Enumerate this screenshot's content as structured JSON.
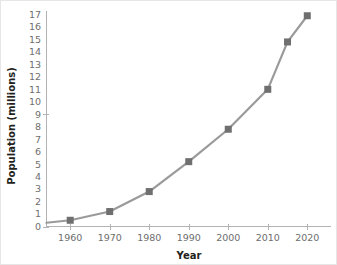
{
  "chart_data": {
    "type": "line",
    "title": "",
    "xlabel": "Year",
    "ylabel": "Population (millions)",
    "x": [
      1960,
      1970,
      1980,
      1990,
      2000,
      2010,
      2015,
      2020
    ],
    "values": [
      0.5,
      1.2,
      2.8,
      5.2,
      7.8,
      11.0,
      14.8,
      16.9
    ],
    "series": [
      {
        "name": "Population",
        "values": [
          0.5,
          1.2,
          2.8,
          5.2,
          7.8,
          11.0,
          14.8,
          16.9
        ]
      }
    ],
    "xlim": [
      1954,
      2026
    ],
    "ylim": [
      0,
      17
    ],
    "xticks": [
      1960,
      1970,
      1980,
      1990,
      2000,
      2010,
      2020
    ],
    "xtick_labels": [
      "1960",
      "1970",
      "1980",
      "1990",
      "2000",
      "2010",
      "2020"
    ],
    "yticks": [
      0,
      1,
      2,
      3,
      4,
      5,
      6,
      7,
      8,
      9,
      10,
      11,
      12,
      13,
      14,
      15,
      16,
      17
    ],
    "ytick_labels": [
      "0",
      "1",
      "2",
      "3",
      "4",
      "5",
      "6",
      "7",
      "8",
      "9",
      "10",
      "11",
      "12",
      "13",
      "14",
      "15",
      "16",
      "17"
    ],
    "grid": false,
    "legend": false,
    "legend_position": "none",
    "marker": "square",
    "colors": {
      "line": "#9a9a9a",
      "marker": "#6f6f6f",
      "axis": "#b3b3b3",
      "tick_text": "#6e6e6e",
      "axis_title_text": "#231f20",
      "background": "#ffffff"
    },
    "line_origin_value": 0.3
  }
}
